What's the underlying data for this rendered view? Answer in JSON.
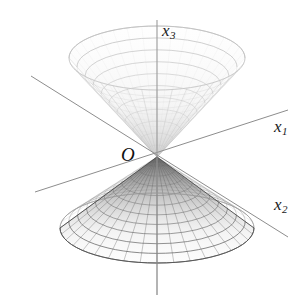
{
  "figure": {
    "kind": "3d-double-cone-wireframe",
    "background_color": "#ffffff",
    "labels": {
      "origin": "O",
      "axis_x1_base": "x",
      "axis_x1_sub": "1",
      "axis_x2_base": "x",
      "axis_x2_sub": "2",
      "axis_x3_base": "x",
      "axis_x3_sub": "3"
    },
    "colors": {
      "axis": "#8a8a8a",
      "axis_vertical": "#9a9a9a",
      "mesh_lower": "#6e6e6e",
      "mesh_upper": "#c9c9c9",
      "shade_lower": "#8d8d8d",
      "shade_upper": "#dedede",
      "label": "#1a1a1a",
      "background": "#ffffff"
    }
  },
  "chart_data": {
    "type": "scatter",
    "title": "",
    "xlabel": "x1",
    "ylabel": "x2",
    "zlabel": "x3",
    "grid": false,
    "legend": "none",
    "surface_equation": "x1^2 + x2^2 = x3^2",
    "geometry": {
      "apex_px": [
        157,
        157
      ],
      "lower_nappe": {
        "opens": "down",
        "rim_center_px": [
          157,
          228
        ],
        "rim_rx_px": 97,
        "rim_ry_px": 35,
        "radial_lines": 36,
        "ring_lines": 11,
        "shading": "dark-near-apex"
      },
      "upper_nappe": {
        "opens": "up",
        "rim_center_px": [
          157,
          58
        ],
        "rim_rx_px": 88,
        "rim_ry_px": 32,
        "radial_lines": 36,
        "ring_lines": 11,
        "shading": "faint"
      },
      "axes_px": {
        "x1": [
          [
            35,
            192
          ],
          [
            288,
            110
          ]
        ],
        "x2": [
          [
            31,
            76
          ],
          [
            288,
            237
          ]
        ],
        "x3": [
          [
            157,
            20
          ],
          [
            157,
            295
          ]
        ]
      }
    }
  }
}
